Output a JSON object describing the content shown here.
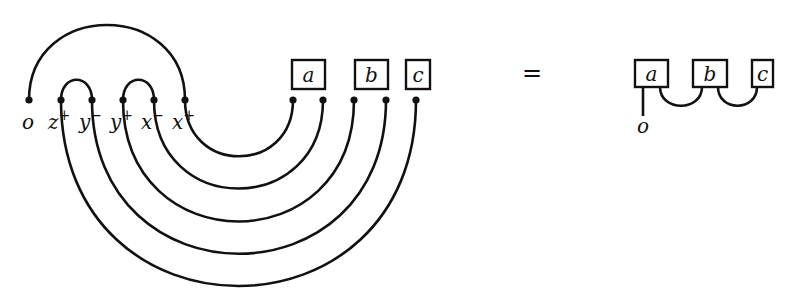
{
  "diagram": {
    "left": {
      "ports": [
        {
          "label": "o",
          "sup": ""
        },
        {
          "label": "z",
          "sup": "+"
        },
        {
          "label": "y",
          "sup": "−"
        },
        {
          "label": "y",
          "sup": "+"
        },
        {
          "label": "x",
          "sup": "−"
        },
        {
          "label": "x",
          "sup": "+"
        }
      ],
      "boxes": [
        {
          "label": "a"
        },
        {
          "label": "b"
        },
        {
          "label": "c"
        }
      ]
    },
    "equals": "=",
    "right": {
      "boxes": [
        {
          "label": "a"
        },
        {
          "label": "b"
        },
        {
          "label": "c"
        }
      ],
      "output_label": "o"
    }
  },
  "colors": {
    "stroke": "#111111",
    "background": "#ffffff"
  }
}
